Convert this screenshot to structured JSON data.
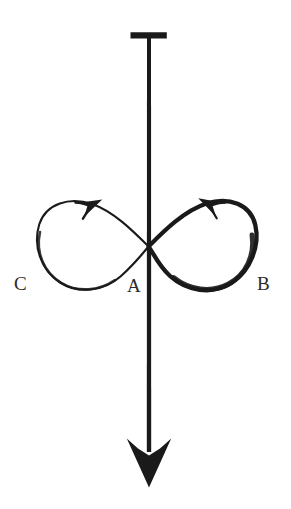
{
  "figure": {
    "background_color": "#ffffff",
    "ink_color": "#1a1a1a",
    "label_color": "#2b2b2b",
    "canvas": {
      "width": 291,
      "height": 509
    }
  },
  "labels": {
    "center": "A",
    "right_loop": "B",
    "left_loop": "C"
  },
  "rod": {
    "name": "vertical-rod",
    "x": 149,
    "top_y": 36,
    "bottom_y": 468,
    "stroke_width": 4,
    "crossbar": {
      "name": "t-bar",
      "x1": 130,
      "x2": 167,
      "y": 35,
      "stroke_width": 6
    },
    "arrowhead": {
      "name": "rod-arrowhead",
      "tip_x": 149,
      "tip_y": 487,
      "left_x": 127,
      "right_x": 171,
      "shoulder_y": 438,
      "notch_y": 455
    }
  },
  "lemniscate": {
    "name": "figure-eight-path",
    "crossing_point": {
      "x": 148,
      "y": 247
    },
    "left_loop": {
      "name": "left-loop",
      "extent_x": 38,
      "top_y": 203,
      "bottom_y": 290,
      "stroke_width": 2.0,
      "direction": "counterclockwise"
    },
    "right_loop": {
      "name": "right-loop",
      "extent_x": 256,
      "top_y": 202,
      "bottom_y": 291,
      "stroke_width": 4.2,
      "direction": "clockwise"
    }
  },
  "arrows": {
    "left": {
      "name": "left-loop-direction-arrow",
      "x": 90,
      "y": 205,
      "points": "up-left",
      "angle_deg": -28
    },
    "right": {
      "name": "right-loop-direction-arrow",
      "x": 210,
      "y": 205,
      "points": "up-right",
      "angle_deg": 28
    }
  }
}
